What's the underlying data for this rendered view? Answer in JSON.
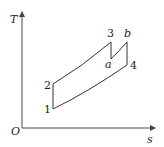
{
  "diagram": {
    "type": "T-s diagram",
    "axes": {
      "y_label": "T",
      "x_label": "s",
      "origin_label": "O"
    },
    "points": [
      {
        "id": "1",
        "label": "1",
        "x": 53,
        "y": 109
      },
      {
        "id": "2",
        "label": "2",
        "x": 53,
        "y": 84
      },
      {
        "id": "3",
        "label": "3",
        "x": 111,
        "y": 42
      },
      {
        "id": "a",
        "label": "a",
        "x": 111,
        "y": 59
      },
      {
        "id": "b",
        "label": "b",
        "x": 127,
        "y": 42
      },
      {
        "id": "4",
        "label": "4",
        "x": 127,
        "y": 65
      }
    ],
    "paths": [
      {
        "from": "1",
        "to": "2",
        "kind": "isentropic"
      },
      {
        "from": "2",
        "to": "3",
        "kind": "isobaric"
      },
      {
        "from": "3",
        "to": "a",
        "kind": "isentropic"
      },
      {
        "from": "a",
        "to": "b",
        "kind": "isobaric"
      },
      {
        "from": "b",
        "to": "4",
        "kind": "isentropic"
      },
      {
        "from": "4",
        "to": "1",
        "kind": "isobaric"
      }
    ],
    "colors": {
      "line": "#333333",
      "background": "#ffffff"
    }
  }
}
